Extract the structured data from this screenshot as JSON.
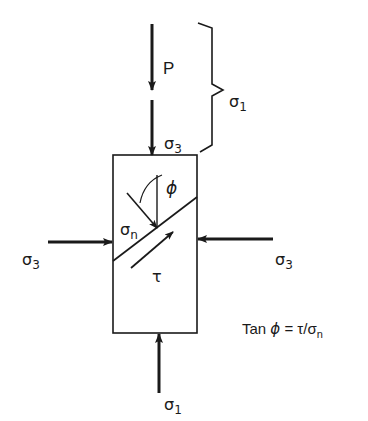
{
  "diagram": {
    "type": "triaxial-shear-stress-element",
    "colors": {
      "ink": "#1a1a1a",
      "background": "#ffffff"
    },
    "labels": {
      "applied_load": "P",
      "sigma3_top": {
        "base": "σ",
        "sub": "3"
      },
      "sigma1_brace": {
        "base": "σ",
        "sub": "1"
      },
      "sigma3_left": {
        "base": "σ",
        "sub": "3"
      },
      "sigma3_right": {
        "base": "σ",
        "sub": "3"
      },
      "sigma1_bottom": {
        "base": "σ",
        "sub": "1"
      },
      "normal_stress": {
        "base": "σ",
        "sub": "n"
      },
      "shear_stress": "τ",
      "friction_angle": "ϕ"
    },
    "equation": {
      "prefix": "Tan ",
      "phi": "ϕ",
      "middle": " = τ/σ",
      "sub": "n"
    },
    "arrows": [
      {
        "name": "load-P",
        "direction": "down"
      },
      {
        "name": "confining-top",
        "direction": "down"
      },
      {
        "name": "confining-left",
        "direction": "right"
      },
      {
        "name": "confining-right",
        "direction": "left"
      },
      {
        "name": "axial-bottom",
        "direction": "up"
      },
      {
        "name": "normal-on-plane",
        "direction": "down-right"
      },
      {
        "name": "shear-along-plane",
        "direction": "up-right"
      }
    ]
  }
}
